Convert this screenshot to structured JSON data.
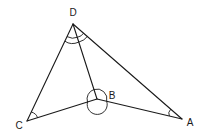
{
  "diagram": {
    "type": "geometry-figure",
    "vertices": {
      "D": {
        "label": "D",
        "x": 73,
        "y": 24,
        "label_x": 73,
        "label_y": 16
      },
      "B": {
        "label": "B",
        "x": 97,
        "y": 99,
        "label_x": 112,
        "label_y": 99
      },
      "C": {
        "label": "C",
        "x": 27,
        "y": 121,
        "label_x": 19,
        "label_y": 129
      },
      "A": {
        "label": "A",
        "x": 182,
        "y": 119,
        "label_x": 190,
        "label_y": 126
      }
    },
    "segments": [
      {
        "from": "D",
        "to": "C"
      },
      {
        "from": "D",
        "to": "B"
      },
      {
        "from": "D",
        "to": "A"
      },
      {
        "from": "C",
        "to": "B"
      },
      {
        "from": "B",
        "to": "A"
      }
    ],
    "angle_marks": [
      {
        "vertex": "D",
        "between": [
          "C",
          "B"
        ],
        "style": "single-arc"
      },
      {
        "vertex": "D",
        "between": [
          "B",
          "A"
        ],
        "style": "single-arc"
      },
      {
        "vertex": "D",
        "between": [
          "C",
          "A"
        ],
        "style": "outer-arc"
      },
      {
        "vertex": "C",
        "between": [
          "D",
          "B"
        ],
        "style": "single-arc"
      },
      {
        "vertex": "A",
        "between": [
          "D",
          "B"
        ],
        "style": "single-arc"
      },
      {
        "vertex": "B",
        "between": [
          "C",
          "A"
        ],
        "style": "reflex-circle"
      }
    ],
    "colors": {
      "stroke": "#1a1a1a",
      "background": "#ffffff"
    }
  }
}
